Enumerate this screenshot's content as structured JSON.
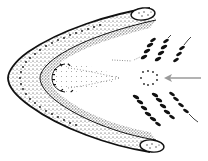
{
  "figure": {
    "colors": {
      "background": "#ffffff",
      "ink": "#111111",
      "stipple": "#333333",
      "arrow": "#9a9a9a"
    },
    "annotations": {
      "arrow": {
        "direction": "left",
        "points_to": "ring of dots at center"
      }
    },
    "tooth_rows": {
      "upper_count": 3,
      "lower_count": 3
    }
  }
}
